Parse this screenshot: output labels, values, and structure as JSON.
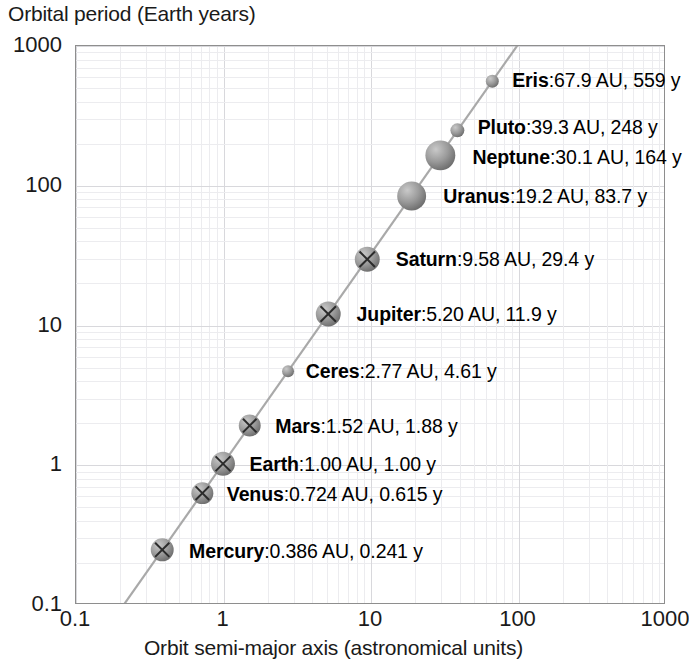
{
  "chart_data": {
    "type": "scatter",
    "title": "",
    "ylabel": "Orbital period (Earth years)",
    "xlabel": "Orbit semi-major axis (astronomical units)",
    "xscale": "log",
    "yscale": "log",
    "xlim": [
      0.1,
      1000
    ],
    "ylim": [
      0.1,
      1000
    ],
    "xticks": [
      "0.1",
      "1",
      "10",
      "100",
      "1000"
    ],
    "yticks": [
      "1000",
      "100",
      "10",
      "1",
      "0.1"
    ],
    "xtick_values": [
      0.1,
      1,
      10,
      100,
      1000
    ],
    "ytick_values": [
      1000,
      100,
      10,
      1,
      0.1
    ],
    "grid": true,
    "legend": "none",
    "trendline": true,
    "x_unit": "AU",
    "y_unit": "y",
    "categories": [
      "Mercury",
      "Venus",
      "Earth",
      "Mars",
      "Ceres",
      "Jupiter",
      "Saturn",
      "Uranus",
      "Neptune",
      "Pluto",
      "Eris"
    ],
    "x": [
      0.386,
      0.724,
      1.0,
      1.52,
      2.77,
      5.2,
      9.58,
      19.2,
      30.1,
      39.3,
      67.9
    ],
    "y": [
      0.241,
      0.615,
      1.0,
      1.88,
      4.61,
      11.9,
      29.4,
      83.7,
      164,
      248,
      559
    ],
    "points": [
      {
        "name": "Mercury",
        "axis": "0.386 AU",
        "period": "0.241 y",
        "x": 0.386,
        "y": 0.241,
        "marker": "cross-sphere",
        "size": 23,
        "label": "Mercury:0.386 AU, 0.241 y"
      },
      {
        "name": "Venus",
        "axis": "0.724 AU",
        "period": "0.615 y",
        "x": 0.724,
        "y": 0.615,
        "marker": "cross-sphere",
        "size": 22,
        "label": "Venus:0.724 AU, 0.615 y"
      },
      {
        "name": "Earth",
        "axis": "1.00 AU",
        "period": "1.00 y",
        "x": 1.0,
        "y": 1.0,
        "marker": "cross-sphere",
        "size": 24,
        "label": "Earth:1.00 AU, 1.00 y"
      },
      {
        "name": "Mars",
        "axis": "1.52 AU",
        "period": "1.88 y",
        "x": 1.52,
        "y": 1.88,
        "marker": "cross-sphere",
        "size": 22,
        "label": "Mars:1.52 AU, 1.88 y"
      },
      {
        "name": "Ceres",
        "axis": "2.77 AU",
        "period": "4.61 y",
        "x": 2.77,
        "y": 4.61,
        "marker": "sphere",
        "size": 12,
        "label": "Ceres:2.77 AU, 4.61 y"
      },
      {
        "name": "Jupiter",
        "axis": "5.20 AU",
        "period": "11.9 y",
        "x": 5.2,
        "y": 11.9,
        "marker": "cross-sphere",
        "size": 25,
        "label": "Jupiter:5.20 AU, 11.9 y"
      },
      {
        "name": "Saturn",
        "axis": "9.58 AU",
        "period": "29.4 y",
        "x": 9.58,
        "y": 29.4,
        "marker": "cross-sphere",
        "size": 25,
        "label": "Saturn:9.58 AU, 29.4 y"
      },
      {
        "name": "Uranus",
        "axis": "19.2 AU",
        "period": "83.7 y",
        "x": 19.2,
        "y": 83.7,
        "marker": "sphere",
        "size": 29,
        "label": "Uranus:19.2 AU, 83.7 y"
      },
      {
        "name": "Neptune",
        "axis": "30.1 AU",
        "period": "164 y",
        "x": 30.1,
        "y": 164,
        "marker": "sphere",
        "size": 30,
        "label": "Neptune:30.1 AU, 164 y"
      },
      {
        "name": "Pluto",
        "axis": "39.3 AU",
        "period": "248 y",
        "x": 39.3,
        "y": 248,
        "marker": "sphere",
        "size": 14,
        "label": "Pluto:39.3 AU, 248 y"
      },
      {
        "name": "Eris",
        "axis": "67.9 AU",
        "period": "559 y",
        "x": 67.9,
        "y": 559,
        "marker": "sphere",
        "size": 13,
        "label": "Eris:67.9 AU, 559 y"
      }
    ]
  },
  "labels": {
    "Mercury": {
      "name": "Mercury",
      "sep": ":",
      "vals": "0.386 AU, 0.241 y"
    },
    "Venus": {
      "name": "Venus",
      "sep": ":",
      "vals": "0.724 AU, 0.615 y"
    },
    "Earth": {
      "name": "Earth",
      "sep": ":",
      "vals": "1.00 AU, 1.00 y"
    },
    "Mars": {
      "name": "Mars",
      "sep": ":",
      "vals": "1.52 AU, 1.88 y"
    },
    "Ceres": {
      "name": "Ceres",
      "sep": ":",
      "vals": "2.77 AU, 4.61 y"
    },
    "Jupiter": {
      "name": "Jupiter",
      "sep": ":",
      "vals": "5.20 AU, 11.9 y"
    },
    "Saturn": {
      "name": "Saturn",
      "sep": ":",
      "vals": "9.58 AU, 29.4 y"
    },
    "Uranus": {
      "name": "Uranus",
      "sep": ":",
      "vals": "19.2 AU, 83.7 y"
    },
    "Neptune": {
      "name": "Neptune",
      "sep": ":",
      "vals": "30.1 AU, 164 y"
    },
    "Pluto": {
      "name": "Pluto",
      "sep": ":",
      "vals": "39.3 AU, 248 y"
    },
    "Eris": {
      "name": "Eris",
      "sep": ":",
      "vals": "67.9 AU, 559 y"
    }
  },
  "colors": {
    "background": "#ffffff",
    "frame": "#8e8e8e",
    "grid_major": "#d8d8dc",
    "grid_minor": "#ececef",
    "text": "#1a1a1a",
    "marker": "#8c8c8c",
    "marker_dark": "#6e6e6e",
    "trendline": "#a9a9a9"
  }
}
